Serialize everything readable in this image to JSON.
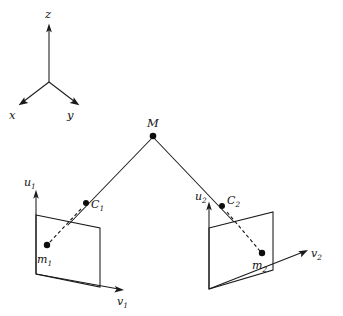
{
  "figure": {
    "background_color": "#ffffff",
    "line_color": "#1a1a1a",
    "point_color": "#0d0d0d",
    "width": 343,
    "height": 316
  },
  "world_frame": {
    "origin": {
      "x": 49,
      "y": 82
    },
    "axes": [
      {
        "name": "z-axis",
        "label": "z",
        "label_x": 45,
        "label_y": 16,
        "tip": {
          "x": 49,
          "y": 24
        },
        "tail": {
          "x": 49,
          "y": 82
        }
      },
      {
        "name": "x-axis",
        "label": "x",
        "label_x": 10,
        "label_y": 117,
        "tip": {
          "x": 19,
          "y": 105
        },
        "tail": {
          "x": 49,
          "y": 82
        }
      },
      {
        "name": "y-axis",
        "label": "y",
        "label_x": 68,
        "label_y": 117,
        "tip": {
          "x": 79,
          "y": 105
        },
        "tail": {
          "x": 49,
          "y": 82
        }
      }
    ]
  },
  "scene_point": {
    "name": "M",
    "label": "M",
    "label_x": 148,
    "label_y": 126,
    "x": 153,
    "y": 136,
    "radius": 3.2
  },
  "cameras": [
    {
      "id": "camera-1",
      "center": {
        "label": "C",
        "subscript": "1",
        "label_x": 92,
        "label_y": 207,
        "x": 86,
        "y": 203,
        "radius": 2.9
      },
      "image_point": {
        "label": "m",
        "subscript": "1",
        "label_x": 38,
        "label_y": 262,
        "x": 47,
        "y": 245,
        "radius": 3.1
      },
      "image_plane": {
        "corners": [
          {
            "x": 36,
            "y": 215
          },
          {
            "x": 100,
            "y": 228
          },
          {
            "x": 100,
            "y": 287
          },
          {
            "x": 36,
            "y": 274
          }
        ]
      },
      "axis_u": {
        "label": "u",
        "subscript": "1",
        "label_x": 25,
        "label_y": 184,
        "tip": {
          "x": 36,
          "y": 190
        },
        "tail": {
          "x": 36,
          "y": 274
        }
      },
      "axis_v": {
        "label": "v",
        "subscript": "1",
        "label_x": 117,
        "label_y": 303,
        "tip": {
          "x": 124,
          "y": 290
        },
        "tail": {
          "x": 36,
          "y": 274
        }
      },
      "ray_from_M": {
        "x1": 153,
        "y1": 136,
        "x2": 69,
        "y2": 224
      },
      "dashed_ray": {
        "x1": 80,
        "y1": 210,
        "x2": 47,
        "y2": 245
      }
    },
    {
      "id": "camera-2",
      "center": {
        "label": "C",
        "subscript": "2",
        "label_x": 228,
        "label_y": 203,
        "x": 222,
        "y": 206,
        "radius": 2.9
      },
      "image_point": {
        "label": "m",
        "subscript": "2",
        "label_x": 253,
        "label_y": 268,
        "x": 262,
        "y": 253,
        "radius": 3.1
      },
      "image_plane": {
        "corners": [
          {
            "x": 209,
            "y": 228
          },
          {
            "x": 273,
            "y": 212
          },
          {
            "x": 273,
            "y": 270
          },
          {
            "x": 209,
            "y": 289
          }
        ]
      },
      "axis_u": {
        "label": "u",
        "subscript": "2",
        "label_x": 196,
        "label_y": 198,
        "tip": {
          "x": 209,
          "y": 202
        },
        "tail": {
          "x": 209,
          "y": 289
        }
      },
      "axis_v": {
        "label": "v",
        "subscript": "2",
        "label_x": 312,
        "label_y": 256,
        "tip": {
          "x": 308,
          "y": 249
        },
        "tail": {
          "x": 209,
          "y": 289
        }
      },
      "ray_from_M": {
        "x1": 153,
        "y1": 136,
        "x2": 233,
        "y2": 220
      },
      "dashed_ray": {
        "x1": 228,
        "y1": 212,
        "x2": 262,
        "y2": 253
      }
    }
  ]
}
